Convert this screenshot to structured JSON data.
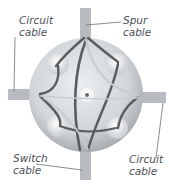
{
  "diagram": {
    "labels": {
      "top_left": {
        "line1": "Circuit",
        "line2": "cable"
      },
      "top_right": {
        "line1": "Spur",
        "line2": "cable"
      },
      "bottom_left": {
        "line1": "Switch",
        "line2": "cable"
      },
      "bottom_right": {
        "line1": "Circuit",
        "line2": "cable"
      }
    },
    "colors": {
      "box": "#d7dadd",
      "box_shadow": "#a9aeb3",
      "terminal": "#eef0f1",
      "cable_sheath": "#b8bcc0",
      "wire_dark": "#5a5c5e",
      "wire_light": "#c9ccce",
      "leader": "#6b7076",
      "text": "#4a4f57"
    }
  }
}
